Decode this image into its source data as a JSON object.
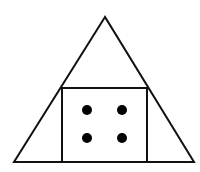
{
  "diagram": {
    "colors": {
      "stroke": "#111111",
      "fill": "#ffffff",
      "dot": "#000000"
    },
    "triangle": {
      "points": [
        [
          105,
          17
        ],
        [
          14,
          162
        ],
        [
          194,
          162
        ]
      ],
      "stroke_width": 2
    },
    "square": {
      "x": 62,
      "y": 88,
      "width": 85,
      "height": 74,
      "stroke_width": 2
    },
    "dots": [
      {
        "cx": 87,
        "cy": 110,
        "r": 5
      },
      {
        "cx": 122,
        "cy": 110,
        "r": 5
      },
      {
        "cx": 87,
        "cy": 138,
        "r": 5
      },
      {
        "cx": 122,
        "cy": 138,
        "r": 5
      }
    ],
    "dot_count": 4
  }
}
